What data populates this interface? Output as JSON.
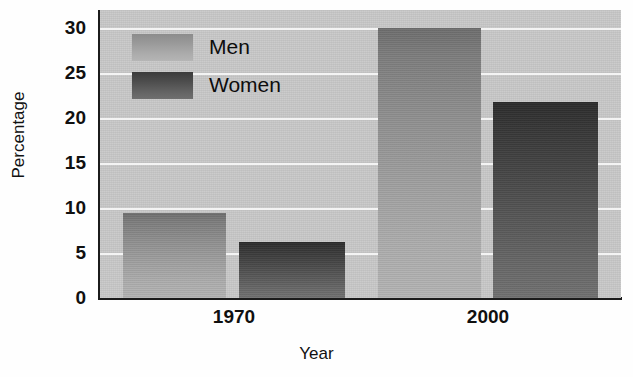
{
  "chart_data": {
    "type": "bar",
    "title": "",
    "xlabel": "Year",
    "ylabel": "Percentage",
    "categories": [
      "1970",
      "2000"
    ],
    "series": [
      {
        "name": "Men",
        "values": [
          9.5,
          30.0
        ]
      },
      {
        "name": "Women",
        "values": [
          6.2,
          21.8
        ]
      }
    ],
    "ylim": [
      0,
      32
    ],
    "yticks": [
      0,
      5,
      10,
      15,
      20,
      25,
      30
    ],
    "ytick_labels": [
      "0",
      "5",
      "10",
      "15",
      "20",
      "25",
      "30"
    ],
    "grid": "horizontal-only",
    "legend_position": "upper-left-inside",
    "colors": {
      "plot_background": "#c9c9c9",
      "gridline": "#f4f4f4",
      "axis": "#1b1b1b",
      "men_bar": "#9a9a9a",
      "women_bar": "#4d4d4d",
      "text": "#101010",
      "figure_background": "#fefefe"
    }
  },
  "legend": {
    "items": [
      {
        "label": "Men",
        "swatch": "men-swatch"
      },
      {
        "label": "Women",
        "swatch": "women-swatch"
      }
    ]
  }
}
